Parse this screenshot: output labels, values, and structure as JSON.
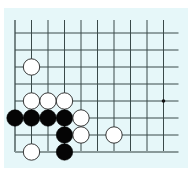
{
  "board": {
    "background_color": "#e6f7f9",
    "line_color": "#3a4a4a",
    "edge_color": "#8a9a9a",
    "columns": 10,
    "rows": 8,
    "origin_x": 15,
    "origin_y": 33,
    "spacing_x": 16.5,
    "spacing_y": 17,
    "top_open_extent": 13,
    "right_open_extent": 15,
    "stone_radius": 8.2,
    "star_points": [
      {
        "col": 9,
        "row": 4
      }
    ],
    "stones": [
      {
        "color": "white",
        "col": 1,
        "row": 2
      },
      {
        "color": "white",
        "col": 1,
        "row": 4
      },
      {
        "color": "white",
        "col": 2,
        "row": 4
      },
      {
        "color": "white",
        "col": 3,
        "row": 4
      },
      {
        "color": "black",
        "col": 0,
        "row": 5
      },
      {
        "color": "black",
        "col": 1,
        "row": 5
      },
      {
        "color": "black",
        "col": 2,
        "row": 5
      },
      {
        "color": "black",
        "col": 3,
        "row": 5
      },
      {
        "color": "white",
        "col": 4,
        "row": 5
      },
      {
        "color": "black",
        "col": 3,
        "row": 6
      },
      {
        "color": "white",
        "col": 4,
        "row": 6
      },
      {
        "color": "white",
        "col": 6,
        "row": 6
      },
      {
        "color": "white",
        "col": 1,
        "row": 7
      },
      {
        "color": "black",
        "col": 3,
        "row": 7
      }
    ]
  }
}
